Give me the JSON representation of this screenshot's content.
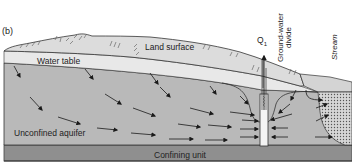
{
  "figure": {
    "panel_label": "(b)",
    "labels": {
      "land_surface": "Land surface",
      "water_table": "Water table",
      "well": "Q",
      "well_subscript": "1",
      "groundwater_divide_line1": "Ground-water",
      "groundwater_divide_line2": "divide",
      "stream": "Stream",
      "unconfined_aquifer": "Unconfined aquifer",
      "confining_unit": "Confining unit"
    },
    "colors": {
      "background": "#ffffff",
      "land_surface_fill": "#dcdcdc",
      "unsaturated_zone": "#e8e8e8",
      "aquifer_fill": "#b9b9b9",
      "confining_unit_fill": "#8f8f8f",
      "arrow": "#1a1a1a",
      "well_fill": "#f4f4f4"
    }
  }
}
